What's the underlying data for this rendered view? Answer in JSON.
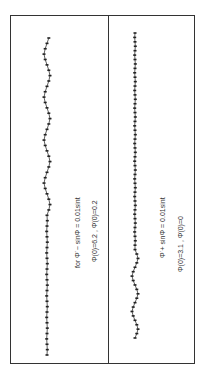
{
  "figure": {
    "orientation": "rotated-90",
    "panels": [
      {
        "id": "left",
        "equation_label": "for Φ̈ − sinΦ = 0.01sint",
        "initial_conditions_label": "Φ(0)=6.2 , Φ̇(0)=0.2",
        "curve_description": "dotted trajectory, nearly flat in first half then small periodic oscillations",
        "oscillation": {
          "early_amplitude": 0.1,
          "late_amplitude": 1.0,
          "transition_fraction": 0.45
        }
      },
      {
        "id": "right",
        "equation_label": "Φ̈ + sinΦ = 0.01sint",
        "initial_conditions_label": "Φ(0)=3.1 , Φ̇(0)=0",
        "curve_description": "dotted trajectory, small oscillations at start then nearly flat dense dots",
        "oscillation": {
          "early_amplitude": 1.0,
          "late_amplitude": 0.1,
          "transition_fraction": 0.3
        }
      }
    ]
  },
  "chart_data": [
    {
      "type": "scatter",
      "title": "for Φ̈ − sinΦ = 0.01sint ; Φ(0)=6.2 , Φ̇(0)=0.2",
      "xlabel": "",
      "ylabel": "",
      "x": [
        0,
        1,
        2,
        3,
        4,
        5,
        6,
        7,
        8,
        9,
        10,
        11,
        12,
        13,
        14,
        15,
        16,
        17,
        18,
        19,
        20,
        21,
        22,
        23,
        24,
        25,
        26,
        27,
        28,
        29,
        30,
        31,
        32,
        33,
        34,
        35,
        36,
        37,
        38,
        39,
        40,
        41,
        42,
        43,
        44,
        45,
        46,
        47,
        48,
        49,
        50,
        51,
        52,
        53,
        54,
        55,
        56,
        57,
        58,
        59
      ],
      "y": [
        0,
        0.1,
        0,
        -0.1,
        0,
        0.1,
        0,
        -0.1,
        0,
        0.1,
        0,
        -0.1,
        0,
        0.1,
        0,
        -0.1,
        0,
        0.1,
        0,
        -0.1,
        0,
        0.1,
        0,
        -0.1,
        0,
        0.1,
        0,
        0.6,
        1,
        0.6,
        0,
        -0.6,
        -1,
        -0.6,
        0,
        0.6,
        1,
        0.6,
        0,
        -0.6,
        -1,
        -0.6,
        0,
        0.6,
        1,
        0.6,
        0,
        -0.6,
        -1,
        -0.6,
        0,
        0.6,
        1,
        0.6,
        0,
        -0.6,
        -1,
        -0.6,
        0,
        0.6
      ],
      "grid": false
    },
    {
      "type": "scatter",
      "title": "Φ̈ + sinΦ = 0.01sint ; Φ(0)=3.1 , Φ̇(0)=0",
      "xlabel": "",
      "ylabel": "",
      "x": [
        0,
        1,
        2,
        3,
        4,
        5,
        6,
        7,
        8,
        9,
        10,
        11,
        12,
        13,
        14,
        15,
        16,
        17,
        18,
        19,
        20,
        21,
        22,
        23,
        24,
        25,
        26,
        27,
        28,
        29,
        30,
        31,
        32,
        33,
        34,
        35,
        36,
        37,
        38,
        39,
        40,
        41,
        42,
        43,
        44,
        45,
        46,
        47,
        48,
        49,
        50,
        51,
        52,
        53,
        54,
        55,
        56,
        57,
        58,
        59,
        60,
        61,
        62,
        63,
        64,
        65,
        66,
        67,
        68,
        69
      ],
      "y": [
        0,
        0.6,
        1,
        0.6,
        0,
        -0.6,
        -1,
        -0.6,
        0,
        0.6,
        1,
        0.6,
        0,
        -0.6,
        -1,
        -0.6,
        0,
        0.6,
        1,
        0.6,
        0,
        0,
        0.1,
        0,
        -0.1,
        0,
        0.1,
        0,
        -0.1,
        0,
        0.1,
        0,
        -0.1,
        0,
        0.1,
        0,
        -0.1,
        0,
        0.1,
        0,
        -0.1,
        0,
        0.1,
        0,
        -0.1,
        0,
        0.1,
        0,
        -0.1,
        0,
        0.1,
        0,
        -0.1,
        0,
        0.1,
        0,
        -0.1,
        0,
        0.1,
        0,
        -0.1,
        0,
        0.1,
        0,
        -0.1,
        0,
        0.1,
        0,
        -0.1,
        0
      ],
      "grid": false
    }
  ]
}
